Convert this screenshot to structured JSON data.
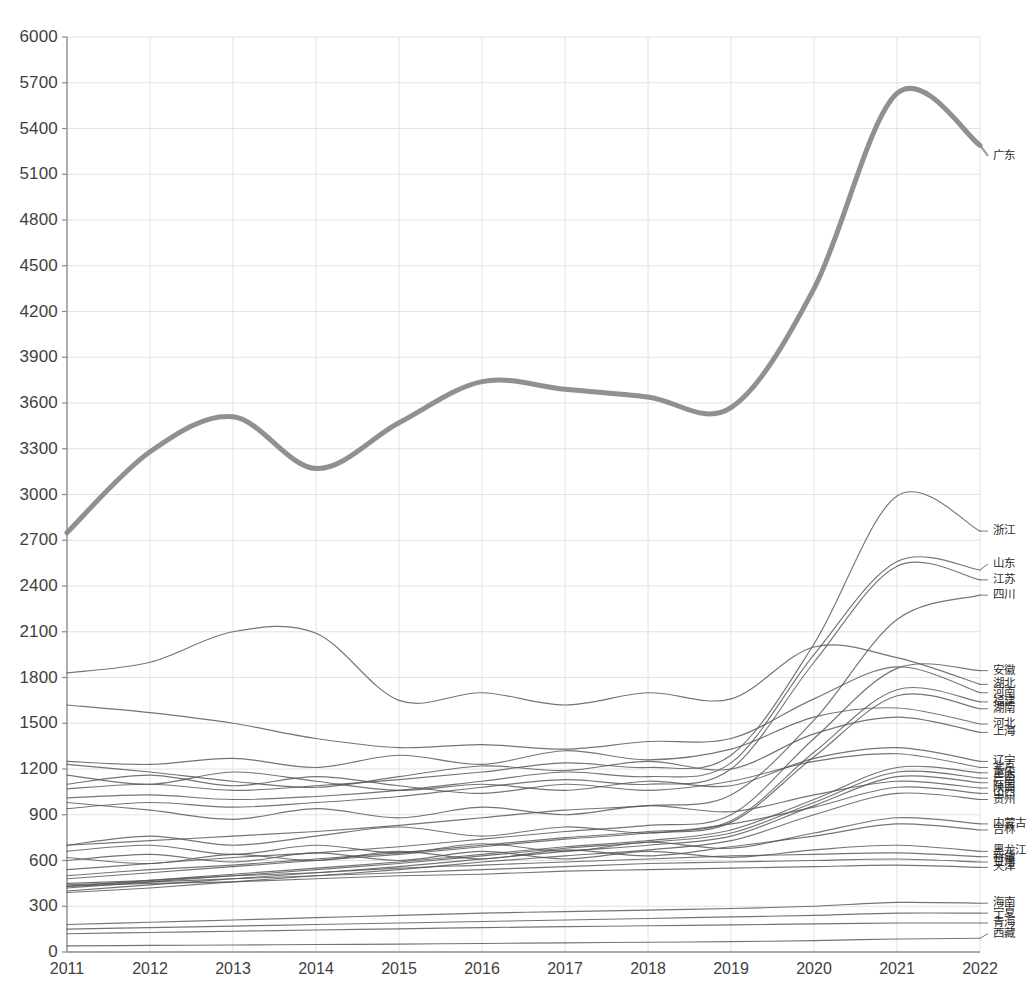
{
  "chart_data": {
    "type": "line",
    "title": "",
    "subtitle": "",
    "xlabel": "",
    "ylabel": "",
    "grid": true,
    "legend_position": "right-inline-labels",
    "x": [
      2011,
      2012,
      2013,
      2014,
      2015,
      2016,
      2017,
      2018,
      2019,
      2020,
      2021,
      2022
    ],
    "xtick_labels": [
      "2011",
      "2012",
      "2013",
      "2014",
      "2015",
      "2016",
      "2017",
      "2018",
      "2019",
      "2020",
      "2021",
      "2022"
    ],
    "xlim": [
      2011,
      2022
    ],
    "ylim": [
      0,
      6000
    ],
    "ytick_labels": [
      "0",
      "300",
      "600",
      "900",
      "1200",
      "1500",
      "1800",
      "2100",
      "2400",
      "2700",
      "3000",
      "3300",
      "3600",
      "3900",
      "4200",
      "4500",
      "4800",
      "5100",
      "5400",
      "5700",
      "6000"
    ],
    "ytick_values": [
      0,
      300,
      600,
      900,
      1200,
      1500,
      1800,
      2100,
      2400,
      2700,
      3000,
      3300,
      3600,
      3900,
      4200,
      4500,
      4800,
      5100,
      5400,
      5700,
      6000
    ],
    "ytick_step": 300,
    "highlight_color": "#8a8a8a",
    "line_color": "#555555",
    "grid_color": "#e2e2e2",
    "axis_color": "#8c8c8c",
    "series": [
      {
        "name": "广东",
        "highlight": true,
        "label_y": 5220,
        "values": [
          2750,
          3280,
          3510,
          3170,
          3470,
          3740,
          3690,
          3640,
          3570,
          4350,
          5630,
          5290
        ]
      },
      {
        "name": "浙江",
        "highlight": false,
        "label_y": 2760,
        "values": [
          1070,
          1100,
          1060,
          1090,
          1130,
          1180,
          1240,
          1210,
          1290,
          2020,
          2990,
          2760
        ]
      },
      {
        "name": "山东",
        "highlight": false,
        "label_y": 2545,
        "values": [
          1010,
          1030,
          1000,
          1020,
          1060,
          1120,
          1180,
          1150,
          1240,
          1950,
          2560,
          2505
        ]
      },
      {
        "name": "江苏",
        "highlight": false,
        "label_y": 2440,
        "values": [
          940,
          980,
          950,
          980,
          1020,
          1080,
          1130,
          1100,
          1200,
          1900,
          2530,
          2440
        ]
      },
      {
        "name": "四川",
        "highlight": false,
        "label_y": 2340,
        "values": [
          700,
          730,
          760,
          790,
          830,
          880,
          930,
          960,
          1030,
          1520,
          2180,
          2340
        ]
      },
      {
        "name": "安徽",
        "highlight": false,
        "label_y": 1845,
        "values": [
          540,
          580,
          620,
          650,
          690,
          740,
          790,
          830,
          900,
          1400,
          1860,
          1845
        ]
      },
      {
        "name": "湖北",
        "highlight": false,
        "label_y": 1755,
        "values": [
          1830,
          1900,
          2100,
          2090,
          1650,
          1700,
          1620,
          1700,
          1660,
          2000,
          1930,
          1755
        ]
      },
      {
        "name": "河南",
        "highlight": false,
        "label_y": 1700,
        "values": [
          1620,
          1570,
          1500,
          1400,
          1340,
          1360,
          1330,
          1380,
          1400,
          1660,
          1870,
          1700
        ]
      },
      {
        "name": "福建",
        "highlight": false,
        "label_y": 1640,
        "values": [
          500,
          540,
          570,
          610,
          650,
          700,
          750,
          790,
          860,
          1310,
          1720,
          1640
        ]
      },
      {
        "name": "湖南",
        "highlight": false,
        "label_y": 1595,
        "values": [
          480,
          520,
          560,
          600,
          640,
          690,
          740,
          780,
          850,
          1280,
          1680,
          1595
        ]
      },
      {
        "name": "河北",
        "highlight": false,
        "label_y": 1495,
        "values": [
          1250,
          1230,
          1270,
          1210,
          1290,
          1230,
          1320,
          1260,
          1330,
          1540,
          1600,
          1495
        ]
      },
      {
        "name": "上海",
        "highlight": false,
        "label_y": 1440,
        "values": [
          1230,
          1180,
          1120,
          1080,
          1150,
          1220,
          1190,
          1250,
          1200,
          1430,
          1540,
          1440
        ]
      },
      {
        "name": "辽宁",
        "highlight": false,
        "label_y": 1250,
        "values": [
          1160,
          1100,
          1180,
          1120,
          1060,
          1100,
          1060,
          1120,
          1090,
          1270,
          1340,
          1250
        ]
      },
      {
        "name": "北京",
        "highlight": false,
        "label_y": 1210,
        "values": [
          1100,
          1160,
          1090,
          1150,
          1090,
          1040,
          1100,
          1060,
          1120,
          1250,
          1300,
          1210
        ]
      },
      {
        "name": "重庆",
        "highlight": false,
        "label_y": 1175,
        "values": [
          430,
          470,
          510,
          550,
          590,
          640,
          690,
          730,
          800,
          1000,
          1210,
          1175
        ]
      },
      {
        "name": "广西",
        "highlight": false,
        "label_y": 1140,
        "values": [
          420,
          460,
          500,
          540,
          580,
          630,
          680,
          720,
          780,
          980,
          1180,
          1140
        ]
      },
      {
        "name": "云南",
        "highlight": false,
        "label_y": 1110,
        "values": [
          400,
          440,
          480,
          520,
          560,
          610,
          660,
          700,
          760,
          960,
          1150,
          1110
        ]
      },
      {
        "name": "陕西",
        "highlight": false,
        "label_y": 1075,
        "values": [
          980,
          930,
          870,
          940,
          880,
          950,
          900,
          960,
          920,
          1030,
          1120,
          1075
        ]
      },
      {
        "name": "山西",
        "highlight": false,
        "label_y": 1040,
        "values": [
          700,
          760,
          700,
          760,
          820,
          760,
          820,
          780,
          840,
          950,
          1080,
          1040
        ]
      },
      {
        "name": "贵州",
        "highlight": false,
        "label_y": 1000,
        "values": [
          390,
          420,
          460,
          500,
          540,
          590,
          630,
          670,
          730,
          900,
          1040,
          1000
        ]
      },
      {
        "name": "内蒙古",
        "highlight": false,
        "label_y": 840,
        "values": [
          660,
          700,
          640,
          700,
          650,
          710,
          660,
          720,
          680,
          780,
          880,
          840
        ]
      },
      {
        "name": "吉林",
        "highlight": false,
        "label_y": 800,
        "values": [
          620,
          580,
          640,
          600,
          660,
          610,
          670,
          630,
          690,
          760,
          840,
          800
        ]
      },
      {
        "name": "黑龙江",
        "highlight": false,
        "label_y": 660,
        "values": [
          600,
          640,
          590,
          650,
          600,
          660,
          610,
          660,
          620,
          670,
          700,
          660
        ]
      },
      {
        "name": "新疆",
        "highlight": false,
        "label_y": 625,
        "values": [
          450,
          470,
          500,
          520,
          550,
          570,
          590,
          610,
          630,
          640,
          650,
          625
        ]
      },
      {
        "name": "甘肃",
        "highlight": false,
        "label_y": 590,
        "values": [
          440,
          460,
          480,
          500,
          520,
          540,
          560,
          580,
          590,
          600,
          610,
          590
        ]
      },
      {
        "name": "天津",
        "highlight": false,
        "label_y": 555,
        "values": [
          430,
          450,
          460,
          480,
          500,
          510,
          530,
          540,
          550,
          560,
          570,
          555
        ]
      },
      {
        "name": "海南",
        "highlight": false,
        "label_y": 320,
        "values": [
          180,
          195,
          210,
          225,
          240,
          255,
          265,
          275,
          285,
          300,
          325,
          320
        ]
      },
      {
        "name": "宁夏",
        "highlight": false,
        "label_y": 255,
        "values": [
          150,
          160,
          170,
          180,
          190,
          200,
          210,
          220,
          230,
          240,
          255,
          255
        ]
      },
      {
        "name": "青海",
        "highlight": false,
        "label_y": 190,
        "values": [
          120,
          128,
          136,
          144,
          152,
          160,
          166,
          172,
          178,
          184,
          190,
          190
        ]
      },
      {
        "name": "西藏",
        "highlight": false,
        "label_y": 120,
        "values": [
          40,
          43,
          46,
          49,
          52,
          56,
          60,
          64,
          68,
          75,
          85,
          90
        ]
      }
    ]
  }
}
